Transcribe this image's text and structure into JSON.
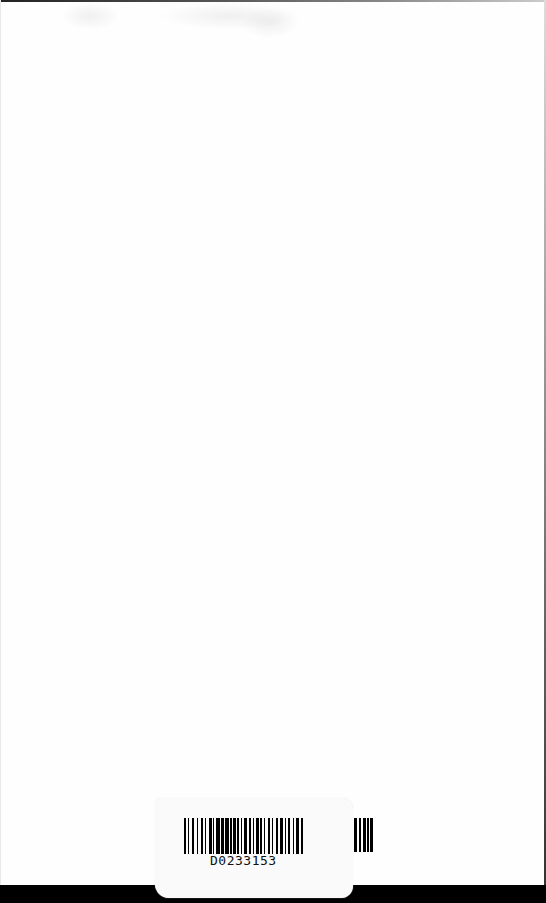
{
  "page": {
    "type": "scanned blank page",
    "background": "#fefefe"
  },
  "barcode_label": {
    "code": "D0233153",
    "bar_color": "#000000",
    "sticker_color": "#fafafa"
  },
  "bottom_band": {
    "color": "#000000"
  }
}
